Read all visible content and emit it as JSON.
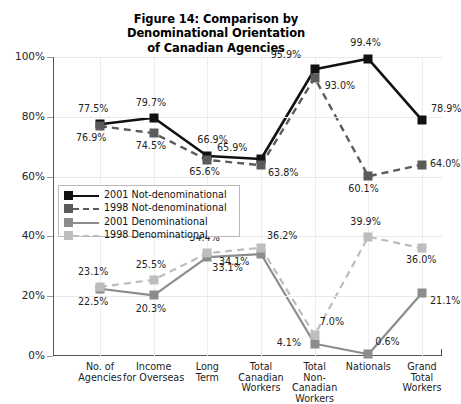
{
  "chart_data": {
    "type": "line",
    "title": "Figure 14: Comparison by Denominational Orientation of Canadian Agencies",
    "title_lines": [
      "Figure 14: Comparison by",
      "Denominational Orientation",
      "of Canadian Agencies"
    ],
    "xlabel": "",
    "ylabel": "",
    "ylim": [
      0,
      100
    ],
    "yticks": [
      0,
      20,
      40,
      60,
      80,
      100
    ],
    "ytick_labels": [
      "0%",
      "20%",
      "40%",
      "60%",
      "80%",
      "100%"
    ],
    "grid": true,
    "legend_position": "inside-left",
    "categories": [
      "No. of Agencies",
      "Income for Overseas",
      "Long Term",
      "Total Canadian Workers",
      "Total Non-Canadian Workers",
      "Nationals",
      "Grand Total Workers"
    ],
    "category_lines": [
      [
        "No. of",
        "Agencies"
      ],
      [
        "Income",
        "for Overseas"
      ],
      [
        "Long",
        "Term"
      ],
      [
        "Total",
        "Canadian",
        "Workers"
      ],
      [
        "Total",
        "Non-",
        "Canadian",
        "Workers"
      ],
      [
        "Nationals"
      ],
      [
        "Grand",
        "Total",
        "Workers"
      ]
    ],
    "series": [
      {
        "name": "2001 Not-denominational",
        "color": "#111111",
        "style": "solid",
        "values": [
          77.5,
          79.7,
          66.9,
          65.9,
          95.9,
          99.4,
          78.9
        ],
        "labels": [
          "77.5%",
          "79.7%",
          "66.9%",
          "65.9%",
          "95.9%",
          "99.4%",
          "78.9%"
        ]
      },
      {
        "name": "1998 Not-denominational",
        "color": "#5b5b5b",
        "style": "dashed",
        "values": [
          76.9,
          74.5,
          65.6,
          63.8,
          93.0,
          60.1,
          64.0
        ],
        "labels": [
          "76.9%",
          "74.5%",
          "65.6%",
          "63.8%",
          "93.0%",
          "60.1%",
          "64.0%"
        ]
      },
      {
        "name": "2001 Denominational",
        "color": "#8c8c8c",
        "style": "solid",
        "values": [
          22.5,
          20.3,
          33.1,
          34.1,
          4.1,
          0.6,
          21.1
        ],
        "labels": [
          "22.5%",
          "20.3%",
          "33.1%",
          "34.1%",
          "4.1%",
          "0.6%",
          "21.1%"
        ]
      },
      {
        "name": "1998 Denominational",
        "color": "#bdbdbd",
        "style": "dashed",
        "values": [
          23.1,
          25.5,
          34.4,
          36.2,
          7.0,
          39.9,
          36.0
        ],
        "labels": [
          "23.1%",
          "25.5%",
          "34.4%",
          "36.2%",
          "7.0%",
          "39.9%",
          "36.0%"
        ]
      }
    ]
  },
  "legend": {
    "entries": [
      {
        "label": "2001 Not-denominational",
        "color": "#111111",
        "style": "solid"
      },
      {
        "label": "1998 Not-denominational",
        "color": "#5b5b5b",
        "style": "dashed"
      },
      {
        "label": "2001 Denominational",
        "color": "#8c8c8c",
        "style": "solid"
      },
      {
        "label": "1998 Denominational",
        "color": "#bdbdbd",
        "style": "dashed"
      }
    ]
  },
  "label_offsets": {
    "s0": [
      {
        "dx": -22,
        "dy": -20
      },
      {
        "dx": -18,
        "dy": -20
      },
      {
        "dx": -10,
        "dy": -21
      },
      {
        "dx": -44,
        "dy": -16
      },
      {
        "dx": -44,
        "dy": -19
      },
      {
        "dx": -18,
        "dy": -21
      },
      {
        "dx": 9,
        "dy": -16
      }
    ],
    "s1": [
      {
        "dx": -24,
        "dy": 7
      },
      {
        "dx": -18,
        "dy": 8
      },
      {
        "dx": -18,
        "dy": 7
      },
      {
        "dx": 7,
        "dy": 3
      },
      {
        "dx": 10,
        "dy": 3
      },
      {
        "dx": -20,
        "dy": 8
      },
      {
        "dx": 8,
        "dy": -6
      }
    ],
    "s2": [
      {
        "dx": -22,
        "dy": 8
      },
      {
        "dx": -18,
        "dy": 9
      },
      {
        "dx": 5,
        "dy": 6
      },
      {
        "dx": -42,
        "dy": 3
      },
      {
        "dx": -38,
        "dy": -6
      },
      {
        "dx": 7,
        "dy": -17
      },
      {
        "dx": 8,
        "dy": 3
      }
    ],
    "s3": [
      {
        "dx": -22,
        "dy": -20
      },
      {
        "dx": -18,
        "dy": -20
      },
      {
        "dx": -18,
        "dy": -20
      },
      {
        "dx": 6,
        "dy": -17
      },
      {
        "dx": 5,
        "dy": -18
      },
      {
        "dx": -18,
        "dy": -20
      },
      {
        "dx": -16,
        "dy": 7
      }
    ]
  }
}
